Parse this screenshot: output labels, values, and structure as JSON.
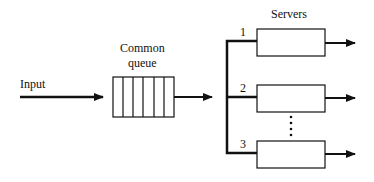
{
  "diagram": {
    "input_label": "Input",
    "queue_label_line1": "Common",
    "queue_label_line2": "queue",
    "servers_label": "Servers",
    "servers": [
      {
        "number": "1"
      },
      {
        "number": "2"
      },
      {
        "number": "3"
      }
    ],
    "ellipsis": "⋮",
    "colors": {
      "line": "#111111",
      "background": "#ffffff"
    }
  }
}
